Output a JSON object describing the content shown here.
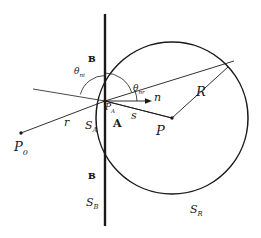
{
  "figure": {
    "name": "ray-refraction-sphere-diagram",
    "background_color": "#ffffff",
    "stroke_color": "#1a1a1a",
    "width": 261,
    "height": 238
  },
  "labels": {
    "theta_incident": {
      "base": "θ",
      "sub": "ni",
      "x": 74,
      "y": 67
    },
    "theta_refracted": {
      "base": "θ",
      "sub": "nr",
      "x": 133,
      "y": 84
    },
    "normal_vector": {
      "base": "n",
      "sub": "",
      "x": 154,
      "y": 92
    },
    "radius": {
      "base": "R",
      "sub": "",
      "x": 196,
      "y": 85
    },
    "distance_s": {
      "base": "s",
      "sub": "",
      "x": 131,
      "y": 110
    },
    "distance_r": {
      "base": "r",
      "sub": "",
      "x": 64,
      "y": 117
    },
    "point_P": {
      "base": "P",
      "sub": "",
      "x": 156,
      "y": 124
    },
    "point_P0": {
      "base": "P",
      "sub": "0",
      "x": 14,
      "y": 140
    },
    "point_PA": {
      "base": "P",
      "sub": "A",
      "x": 105,
      "y": 105
    },
    "region_A": {
      "base": "A",
      "sub": "",
      "x": 113,
      "y": 120
    },
    "surface_SA": {
      "base": "S",
      "sub": "A",
      "x": 85,
      "y": 121
    },
    "surface_SB": {
      "base": "S",
      "sub": "B",
      "x": 86,
      "y": 198
    },
    "surface_SR": {
      "base": "S",
      "sub": "R",
      "x": 190,
      "y": 205
    },
    "medium_B_upper": {
      "base": "ʙ",
      "sub": "",
      "x": 88,
      "y": 55
    },
    "medium_B_lower": {
      "base": "ʙ",
      "sub": "",
      "x": 88,
      "y": 172
    }
  },
  "geometry": {
    "vertical_plane": {
      "x": 105,
      "y1": 14,
      "y2": 226
    },
    "circle": {
      "cx": 172,
      "cy": 118,
      "r": 76
    },
    "origin_PA": {
      "x": 105,
      "y": 101
    },
    "center_P": {
      "x": 172,
      "y": 118
    },
    "source_P0": {
      "x": 21,
      "y": 133
    },
    "normal_arrow_tip": {
      "x": 149,
      "y": 101
    },
    "refracted_ray_tip": {
      "x": 234,
      "y": 61
    },
    "incident_ray_ext": {
      "x": 33,
      "y": 89
    },
    "arc_incident_radius": 25,
    "arc_refracted_radius": 28
  }
}
